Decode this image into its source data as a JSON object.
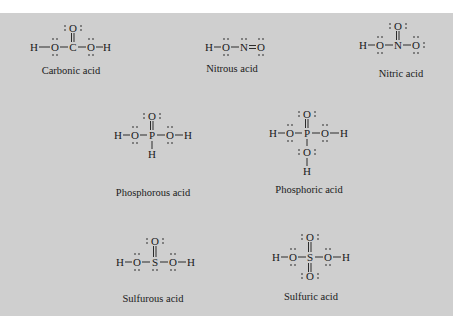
{
  "figure": {
    "background": "#cfcfcf",
    "molecules": [
      {
        "id": "carbonic",
        "name": "Carbonic acid",
        "formula_atoms": [
          "H",
          "O",
          "C",
          "O",
          "H",
          "O"
        ],
        "bonds": [
          "H-O single",
          "O-C single",
          "C=O double (top)",
          "C-O single",
          "O-H single"
        ]
      },
      {
        "id": "nitrous",
        "name": "Nitrous acid",
        "formula_atoms": [
          "H",
          "O",
          "N",
          "O"
        ],
        "bonds": [
          "H-O single",
          "O-N single",
          "N=O double"
        ]
      },
      {
        "id": "nitric",
        "name": "Nitric acid",
        "formula_atoms": [
          "H",
          "O",
          "N",
          "O",
          "O"
        ],
        "bonds": [
          "H-O single",
          "O-N single",
          "N=O double (top)",
          "N-O single"
        ]
      },
      {
        "id": "phosphorous",
        "name": "Phosphorous acid",
        "formula_atoms": [
          "H",
          "O",
          "P",
          "O",
          "H",
          "O",
          "H"
        ],
        "bonds": [
          "H-O single",
          "O-P single",
          "P=O double (top)",
          "P-O single",
          "O-H single",
          "P-H single (bottom)"
        ]
      },
      {
        "id": "phosphoric",
        "name": "Phosphoric acid",
        "formula_atoms": [
          "H",
          "O",
          "P",
          "O",
          "H",
          "O",
          "O",
          "H"
        ],
        "bonds": [
          "H-O single",
          "O-P single",
          "P=O double (top)",
          "P-O single",
          "O-H single",
          "P-O single (bottom)",
          "O-H single (bottom)"
        ]
      },
      {
        "id": "sulfurous",
        "name": "Sulfurous acid",
        "formula_atoms": [
          "H",
          "O",
          "S",
          "O",
          "H",
          "O"
        ],
        "bonds": [
          "H-O single",
          "O-S single",
          "S=O double (top)",
          "S-O single",
          "O-H single"
        ]
      },
      {
        "id": "sulfuric",
        "name": "Sulfuric acid",
        "formula_atoms": [
          "H",
          "O",
          "S",
          "O",
          "H",
          "O",
          "O"
        ],
        "bonds": [
          "H-O single",
          "O-S single",
          "S=O double (top)",
          "S=O double (bottom)",
          "S-O single",
          "O-H single"
        ]
      }
    ]
  },
  "labels": {
    "carbonic": "Carbonic acid",
    "nitrous": "Nitrous acid",
    "nitric": "Nitric acid",
    "phosphorous": "Phosphorous acid",
    "phosphoric": "Phosphoric acid",
    "sulfurous": "Sulfurous acid",
    "sulfuric": "Sulfuric acid"
  },
  "atoms": {
    "H": "H",
    "O": "O",
    "C": "C",
    "N": "N",
    "P": "P",
    "S": "S"
  }
}
